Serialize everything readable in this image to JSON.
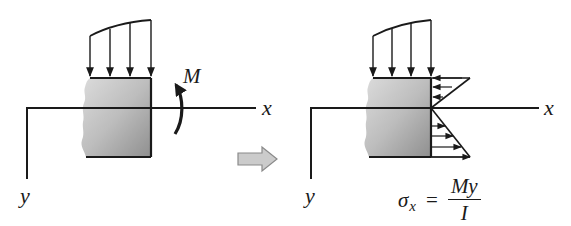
{
  "figure": {
    "colors": {
      "line": "#1a1a1a",
      "block_fill_light": "#d8d8d8",
      "block_fill_dark": "#9a9a9a",
      "transition_arrow_fill": "#c9c9c9",
      "transition_arrow_stroke": "#8a8a8a"
    }
  },
  "left_panel": {
    "x_axis_label": "x",
    "y_axis_label": "y",
    "moment_label": "M",
    "distributed_load_arrows": 4
  },
  "transition_arrow": {
    "icon": "right-arrow-icon"
  },
  "right_panel": {
    "x_axis_label": "x",
    "y_axis_label": "y",
    "stress_arrows_top": 3,
    "stress_arrows_bottom": 4,
    "formula": {
      "lhs_symbol": "σ",
      "lhs_subscript": "x",
      "equals": "=",
      "numerator": "My",
      "denominator": "I"
    }
  }
}
